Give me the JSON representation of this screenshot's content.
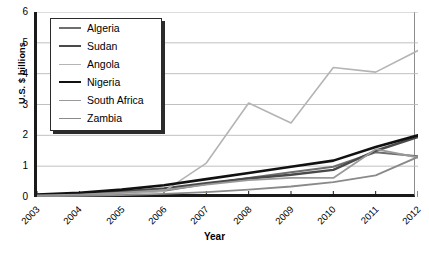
{
  "chart_data": {
    "type": "line",
    "title": "",
    "xlabel": "Year",
    "ylabel": "U.S. $ billions",
    "x": [
      2003,
      2004,
      2005,
      2006,
      2007,
      2008,
      2009,
      2010,
      2011,
      2012
    ],
    "xtick_labels": [
      "2003",
      "2004",
      "2005",
      "2006",
      "2007",
      "2008",
      "2009",
      "2010",
      "2011",
      "2012"
    ],
    "ytick_labels": [
      "0",
      "1",
      "2",
      "3",
      "4",
      "5",
      "6"
    ],
    "yticks": [
      0,
      1,
      2,
      3,
      4,
      5,
      6
    ],
    "ylim": [
      0,
      6
    ],
    "xlim": [
      2003,
      2012
    ],
    "grid": "horizontal",
    "legend_position": "top-left-inside",
    "series": [
      {
        "name": "Algeria",
        "color": "#6e6e6e",
        "width": 2.0,
        "values": [
          0.05,
          0.08,
          0.12,
          0.2,
          0.42,
          0.62,
          0.8,
          0.98,
          1.45,
          1.32
        ]
      },
      {
        "name": "Sudan",
        "color": "#4a4a4a",
        "width": 2.4,
        "values": [
          0.06,
          0.1,
          0.18,
          0.28,
          0.45,
          0.6,
          0.72,
          0.88,
          1.5,
          1.95
        ]
      },
      {
        "name": "Angola",
        "color": "#b4b4b4",
        "width": 1.6,
        "values": [
          0.04,
          0.07,
          0.1,
          0.18,
          1.1,
          3.05,
          2.4,
          4.2,
          4.05,
          4.75
        ]
      },
      {
        "name": "Nigeria",
        "color": "#111111",
        "width": 2.6,
        "values": [
          0.08,
          0.14,
          0.24,
          0.38,
          0.58,
          0.78,
          0.98,
          1.18,
          1.62,
          2.0
        ]
      },
      {
        "name": "South Africa",
        "color": "#9a9a9a",
        "width": 1.8,
        "values": [
          0.05,
          0.08,
          0.14,
          0.22,
          0.4,
          0.55,
          0.62,
          0.62,
          1.55,
          1.28
        ]
      },
      {
        "name": "Zambia",
        "color": "#8a8a8a",
        "width": 1.8,
        "values": [
          0.02,
          0.04,
          0.06,
          0.1,
          0.16,
          0.24,
          0.34,
          0.48,
          0.7,
          1.3
        ]
      }
    ]
  }
}
